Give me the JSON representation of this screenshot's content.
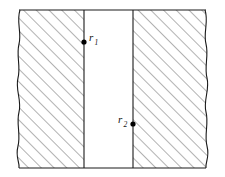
{
  "figure": {
    "type": "cross-section-hatched-slab",
    "title": "",
    "background_color": "#ffffff",
    "outline_color": "#1a1a1a",
    "hatch_color": "#555555",
    "dot_color": "#000000",
    "canvas": {
      "width": 225,
      "height": 177
    },
    "frame": {
      "top_y": 10,
      "bottom_y": 168,
      "left_break_x": 18,
      "right_break_x": 207
    },
    "regions": [
      {
        "id": "left-medium",
        "name": "left-hatched-region",
        "fill": "hatch-diagonal",
        "hatch_angle_deg": 45,
        "hatch_spacing_px": 9,
        "x_start": 18,
        "x_end": 84
      },
      {
        "id": "gap",
        "name": "central-clear-channel",
        "fill": "none",
        "x_start": 84,
        "x_end": 133
      },
      {
        "id": "right-medium",
        "name": "right-hatched-region",
        "fill": "hatch-diagonal",
        "hatch_angle_deg": 45,
        "hatch_spacing_px": 9,
        "x_start": 133,
        "x_end": 207
      }
    ],
    "boundaries": [
      {
        "id": "left-interface",
        "name": "left-vertical-interface",
        "x": 84
      },
      {
        "id": "right-interface",
        "name": "right-vertical-interface",
        "x": 133
      }
    ],
    "points": [
      {
        "id": "r1",
        "label": "r",
        "subscript": "1",
        "x": 84,
        "y": 42,
        "label_x": 89,
        "label_y": 41,
        "label_position": "right"
      },
      {
        "id": "r2",
        "label": "r",
        "subscript": "2",
        "x": 133,
        "y": 124,
        "label_x": 118,
        "label_y": 123,
        "label_position": "left"
      }
    ]
  }
}
